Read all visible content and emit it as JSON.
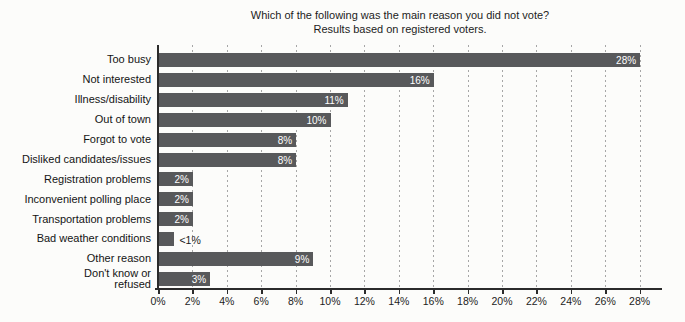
{
  "chart_data": {
    "type": "bar",
    "orientation": "horizontal",
    "title": "Which of the following was the main reason you did not vote?",
    "subtitle": "Results based on registered voters.",
    "categories": [
      "Too busy",
      "Not interested",
      "Illness/disability",
      "Out of town",
      "Forgot to vote",
      "Disliked candidates/issues",
      "Registration problems",
      "Inconvenient polling place",
      "Transportation problems",
      "Bad weather conditions",
      "Other reason",
      "Don't know or\nrefused"
    ],
    "values": [
      28,
      16,
      11,
      10,
      8,
      8,
      2,
      2,
      2,
      0.9,
      9,
      3
    ],
    "value_labels": [
      "28%",
      "16%",
      "11%",
      "10%",
      "8%",
      "8%",
      "2%",
      "2%",
      "2%",
      "<1%",
      "9%",
      "3%"
    ],
    "value_label_inside": [
      true,
      true,
      true,
      true,
      true,
      true,
      true,
      true,
      true,
      false,
      true,
      true
    ],
    "xlabel": "",
    "ylabel": "",
    "xlim": [
      0,
      29.3
    ],
    "x_tick_values": [
      0,
      2,
      4,
      6,
      8,
      10,
      12,
      14,
      16,
      18,
      20,
      22,
      24,
      26,
      28
    ],
    "x_tick_labels": [
      "0%",
      "2%",
      "4%",
      "6%",
      "8%",
      "10%",
      "12%",
      "14%",
      "16%",
      "18%",
      "20%",
      "22%",
      "24%",
      "26%",
      "28%"
    ],
    "grid": "vertical-dotted",
    "legend": "none",
    "colors": {
      "bar": "#58595b",
      "value_label_inside": "#ffffff",
      "value_label_outside": "#1a1a1a",
      "axis": "#2b2b2b",
      "gridline": "#a6a6a6",
      "text": "#1c1c1c"
    }
  }
}
